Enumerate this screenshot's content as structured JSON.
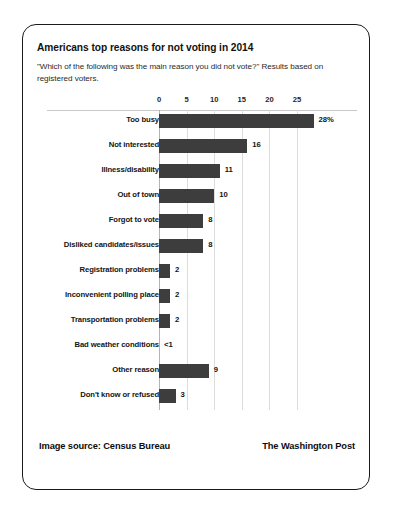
{
  "card": {
    "title": "Americans top reasons for not voting in 2014",
    "subtitle": "\"Which of the following was the main reason you did not vote?\" Results based on registered voters.",
    "source_credit": "Image source: Census Bureau",
    "publisher_credit": "The Washington Post"
  },
  "colors": {
    "bar": "#3d3d3d",
    "gridline": "#dcdcdc",
    "axis": "#c9c9c9",
    "text": "#141414",
    "border": "#1b1b1b",
    "background": "#ffffff"
  },
  "chart_data": {
    "type": "bar",
    "orientation": "horizontal",
    "title": "Americans top reasons for not voting in 2014",
    "subtitle": "\"Which of the following was the main reason you did not vote?\" Results based on registered voters.",
    "xlabel": "",
    "ylabel": "",
    "xlim": [
      0,
      28
    ],
    "xticks": [
      0,
      5,
      10,
      15,
      20,
      25
    ],
    "xtick_labels": [
      "0",
      "5",
      "10",
      "15",
      "20",
      "25"
    ],
    "grid": true,
    "legend": false,
    "units": "percent",
    "categories": [
      "Too busy",
      "Not interested",
      "Illness/disability",
      "Out of town",
      "Forgot to vote",
      "Disliked candidates/issues",
      "Registration problems",
      "Inconvenient polling place",
      "Transportation problems",
      "Bad weather conditions",
      "Other reason",
      "Don't know or refused"
    ],
    "values": [
      28,
      16,
      11,
      10,
      8,
      8,
      2,
      2,
      2,
      0,
      9,
      3
    ],
    "value_labels": [
      "28%",
      "16",
      "11",
      "10",
      "8",
      "8",
      "2",
      "2",
      "2",
      "<1",
      "9",
      "3"
    ]
  }
}
